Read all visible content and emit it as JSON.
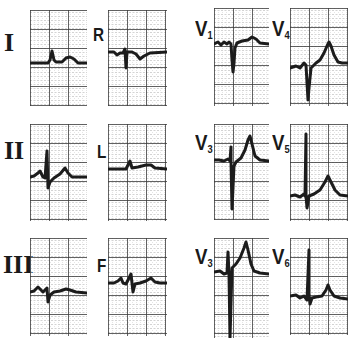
{
  "figure": {
    "background": "#ffffff",
    "grid_minor_color": "#b5b5b5",
    "grid_major_color": "#3a3a3a",
    "trace_color": "#1c1c1c"
  },
  "leads": [
    {
      "id": "I",
      "label": "I",
      "sub": "",
      "font": "serif",
      "label_x": 4,
      "label_y": 30,
      "label_size": 26,
      "x": 30,
      "y": 10,
      "w": 57,
      "h": 96,
      "trace": "M0,53 L18,53 L20,50 L22,41 L24,50 L26,52 L32,52 L36,48 L40,47 L44,49 L48,53 L57,53",
      "baseline_width": 3
    },
    {
      "id": "R",
      "label": "R",
      "sub": "",
      "font": "sans",
      "label_x": 93,
      "label_y": 26,
      "label_size": 18,
      "x": 108,
      "y": 10,
      "w": 59,
      "h": 96,
      "trace": "M0,42 L6,42 L9,45 L12,43 L15,43 L17,39 L18,58 L19,42 L24,42 L28,44 L32,49 L36,46 L42,43 L59,42",
      "baseline_width": 3
    },
    {
      "id": "V1",
      "label": "V",
      "sub": "1",
      "font": "sans",
      "label_x": 195,
      "label_y": 18,
      "label_size": 22,
      "x": 214,
      "y": 8,
      "w": 55,
      "h": 98,
      "trace": "M0,36 L4,34 L7,37 L10,34 L13,36 L15,34 L17,36 L18,52 L19,64 L20,55 L21,40 L23,35 L28,33 L34,32 L38,29 L42,31 L46,35 L55,36",
      "baseline_width": 3
    },
    {
      "id": "V4",
      "label": "V",
      "sub": "4",
      "font": "sans",
      "label_x": 272,
      "label_y": 18,
      "label_size": 22,
      "x": 290,
      "y": 8,
      "w": 58,
      "h": 98,
      "trace": "M0,60 L6,58 L10,60 L14,55 L16,57 L18,92 L19,80 L21,60 L26,55 L30,52 L34,45 L37,38 L39,34 L41,38 L44,47 L48,54 L52,55 L58,55",
      "baseline_width": 3
    },
    {
      "id": "II",
      "label": "II",
      "sub": "",
      "font": "serif",
      "label_x": 4,
      "label_y": 138,
      "label_size": 26,
      "x": 30,
      "y": 124,
      "w": 57,
      "h": 97,
      "trace": "M0,53 L4,52 L8,49 L10,47 L13,53 L15,54 L17,27 L18,64 L20,58 L24,54 L30,50 L35,44 L38,49 L42,53 L57,53",
      "baseline_width": 3
    },
    {
      "id": "L",
      "label": "L",
      "sub": "",
      "font": "sans",
      "label_x": 97,
      "label_y": 143,
      "label_size": 18,
      "x": 108,
      "y": 124,
      "w": 59,
      "h": 97,
      "trace": "M0,45 L18,45 L20,41 L22,37 L24,44 L30,43 L38,41 L43,41 L47,44 L59,45",
      "baseline_width": 3
    },
    {
      "id": "V3a",
      "label": "V",
      "sub": "3",
      "font": "sans",
      "label_x": 195,
      "label_y": 132,
      "label_size": 22,
      "x": 214,
      "y": 124,
      "w": 55,
      "h": 96,
      "trace": "M0,36 L5,36 L10,37 L14,35 L16,37 L17,23 L17,37 L18,85 L20,42 L22,38 L27,34 L31,26 L34,16 L36,12 L38,20 L41,32 L46,36 L55,37",
      "baseline_width": 3
    },
    {
      "id": "V5",
      "label": "V",
      "sub": "5",
      "font": "sans",
      "label_x": 272,
      "label_y": 132,
      "label_size": 22,
      "x": 290,
      "y": 124,
      "w": 58,
      "h": 97,
      "trace": "M0,72 L5,71 L10,73 L14,70 L15,72 L16,10 L16,72 L17,84 L19,72 L24,70 L30,66 L35,58 L38,52 L41,58 L45,66 L50,71 L58,72",
      "baseline_width": 3
    },
    {
      "id": "III",
      "label": "III",
      "sub": "",
      "font": "serif",
      "label_x": 3,
      "label_y": 252,
      "label_size": 26,
      "x": 30,
      "y": 238,
      "w": 57,
      "h": 98,
      "trace": "M0,54 L4,53 L8,49 L10,51 L13,54 L15,52 L17,50 L18,64 L20,57 L24,54 L30,53 L36,51 L40,52 L46,54 L57,55",
      "baseline_width": 3
    },
    {
      "id": "F",
      "label": "F",
      "sub": "",
      "font": "sans",
      "label_x": 97,
      "label_y": 257,
      "label_size": 18,
      "x": 108,
      "y": 238,
      "w": 59,
      "h": 98,
      "trace": "M0,45 L6,45 L10,43 L13,40 L15,45 L18,46 L23,36 L25,54 L27,46 L32,45 L38,43 L43,40 L47,44 L52,45 L59,45",
      "baseline_width": 3
    },
    {
      "id": "V3b",
      "label": "V",
      "sub": "3",
      "font": "sans",
      "label_x": 195,
      "label_y": 246,
      "label_size": 22,
      "x": 214,
      "y": 238,
      "w": 55,
      "h": 100,
      "trace": "M0,34 L6,33 L10,36 L13,35 L14,14 L15,36 L16,100 L18,30 L22,26 L26,20 L30,10 L32,4 L34,12 L37,26 L40,33 L46,35 L55,36",
      "baseline_width": 3
    },
    {
      "id": "V6",
      "label": "V",
      "sub": "6",
      "font": "sans",
      "label_x": 272,
      "label_y": 246,
      "label_size": 22,
      "x": 290,
      "y": 238,
      "w": 58,
      "h": 97,
      "trace": "M0,58 L6,57 L10,60 L14,58 L17,62 L19,12 L19,56 L20,66 L22,60 L26,59 L32,58 L36,52 L38,47 L40,52 L44,58 L50,60 L58,61",
      "baseline_width": 3
    }
  ]
}
